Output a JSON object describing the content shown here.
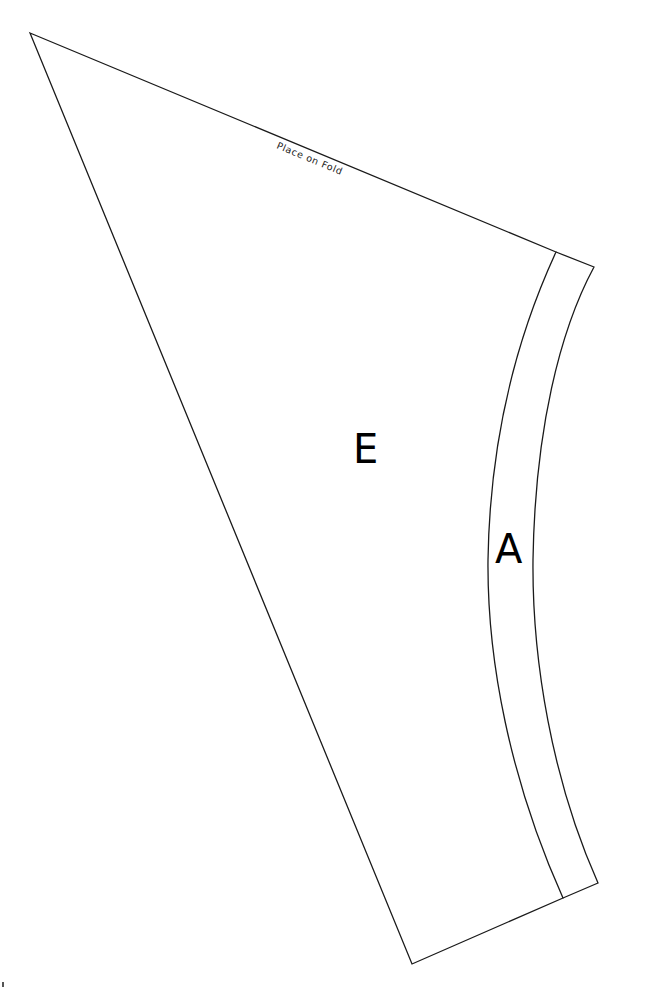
{
  "pattern": {
    "fold_label": "Place on Fold",
    "pieces": [
      {
        "id": "E",
        "label": "E"
      },
      {
        "id": "A",
        "label": "A"
      }
    ],
    "stroke_color": "#1a1a1a",
    "background": "#ffffff"
  }
}
